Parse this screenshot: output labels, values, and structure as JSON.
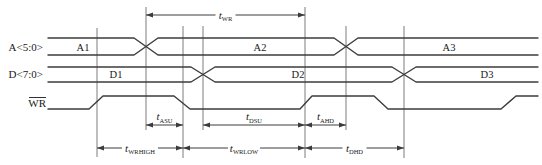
{
  "diagram_type": "write-cycle-timing-diagram",
  "colors": {
    "background": "#ffffff",
    "waveform_line": "#3c3c3c",
    "reference_line": "#5a5a5a",
    "text": "#1a1a1a"
  },
  "signals": [
    {
      "name": "A<5:0>",
      "type": "bus",
      "segment_labels": [
        {
          "text": "A1",
          "x": 83,
          "y": 51
        },
        {
          "text": "A2",
          "x": 260,
          "y": 51
        },
        {
          "text": "A3",
          "x": 449,
          "y": 51
        }
      ],
      "polylines": [
        [
          [
            48,
            38
          ],
          [
            134,
            38
          ],
          [
            158,
            55
          ],
          [
            334,
            55
          ],
          [
            358,
            38
          ],
          [
            538,
            38
          ]
        ],
        [
          [
            48,
            55
          ],
          [
            134,
            55
          ],
          [
            158,
            38
          ],
          [
            334,
            38
          ],
          [
            358,
            55
          ],
          [
            538,
            55
          ]
        ]
      ]
    },
    {
      "name": "D<7:0>",
      "type": "bus",
      "segment_labels": [
        {
          "text": "D1",
          "x": 116,
          "y": 78
        },
        {
          "text": "D2",
          "x": 298,
          "y": 78
        },
        {
          "text": "D3",
          "x": 487,
          "y": 78
        }
      ],
      "polylines": [
        [
          [
            48,
            67
          ],
          [
            191,
            67
          ],
          [
            215,
            82
          ],
          [
            392,
            82
          ],
          [
            416,
            67
          ],
          [
            538,
            67
          ]
        ],
        [
          [
            48,
            82
          ],
          [
            191,
            82
          ],
          [
            215,
            67
          ],
          [
            392,
            67
          ],
          [
            416,
            82
          ],
          [
            538,
            82
          ]
        ]
      ]
    },
    {
      "name": "WR",
      "type": "binary",
      "overline": true,
      "polylines": [
        [
          [
            48,
            109
          ],
          [
            89,
            109
          ],
          [
            103,
            96
          ],
          [
            174,
            96
          ],
          [
            190,
            109
          ],
          [
            300,
            109
          ],
          [
            312,
            96
          ],
          [
            374,
            96
          ],
          [
            388,
            109
          ],
          [
            501,
            109
          ],
          [
            516,
            96
          ],
          [
            538,
            96
          ]
        ]
      ]
    }
  ],
  "reference_lines": [
    {
      "x": 97,
      "y1": 28,
      "y2": 157
    },
    {
      "x": 146,
      "y1": 7,
      "y2": 130
    },
    {
      "x": 183,
      "y1": 26,
      "y2": 158
    },
    {
      "x": 203,
      "y1": 26,
      "y2": 130
    },
    {
      "x": 305,
      "y1": 7,
      "y2": 158
    },
    {
      "x": 346,
      "y1": 26,
      "y2": 130
    },
    {
      "x": 404,
      "y1": 26,
      "y2": 158
    }
  ],
  "timings": [
    {
      "base": "t",
      "sub": "WR",
      "x1": 146,
      "x2": 305,
      "y": 15,
      "style": "inline"
    },
    {
      "base": "t",
      "sub": "ASU",
      "x1": 146,
      "x2": 183,
      "y": 125,
      "style": "above"
    },
    {
      "base": "t",
      "sub": "DSU",
      "x1": 203,
      "x2": 305,
      "y": 125,
      "style": "above"
    },
    {
      "base": "t",
      "sub": "AHD",
      "x1": 305,
      "x2": 346,
      "y": 125,
      "style": "above"
    },
    {
      "base": "t",
      "sub": "WRHIGH",
      "x1": 97,
      "x2": 183,
      "y": 148,
      "style": "inline"
    },
    {
      "base": "t",
      "sub": "WRLOW",
      "x1": 183,
      "x2": 305,
      "y": 148,
      "style": "inline"
    },
    {
      "base": "t",
      "sub": "DHD",
      "x1": 305,
      "x2": 404,
      "y": 148,
      "style": "inline"
    }
  ]
}
